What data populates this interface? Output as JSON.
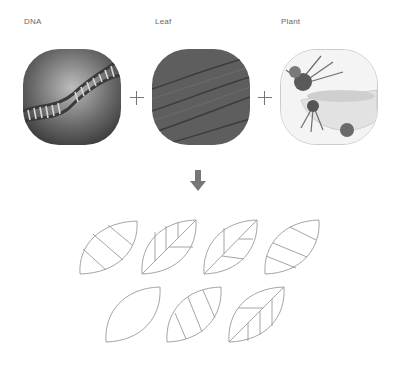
{
  "inputs": [
    {
      "label": "DNA",
      "image": "dna-helix-photo"
    },
    {
      "label": "Leaf",
      "image": "leaf-texture-photo"
    },
    {
      "label": "Plant",
      "image": "herbs-mortar-photo"
    }
  ],
  "operators": [
    "+",
    "+"
  ],
  "result_arrow": "down-arrow-icon",
  "colors": {
    "label_text": "#666666",
    "leaf_stroke": "#9a9a9a",
    "arrow": "#777777"
  },
  "leaf_variants": [
    {
      "row": 1,
      "pattern": "three-diagonal-stripes"
    },
    {
      "row": 1,
      "pattern": "midrib-with-vertical-veins-left"
    },
    {
      "row": 1,
      "pattern": "midrib-with-horizontal-veins-right"
    },
    {
      "row": 1,
      "pattern": "three-descending-stripes"
    },
    {
      "row": 2,
      "pattern": "empty"
    },
    {
      "row": 2,
      "pattern": "three-steep-stripes"
    },
    {
      "row": 2,
      "pattern": "midrib-with-vertical-veins-right"
    }
  ]
}
